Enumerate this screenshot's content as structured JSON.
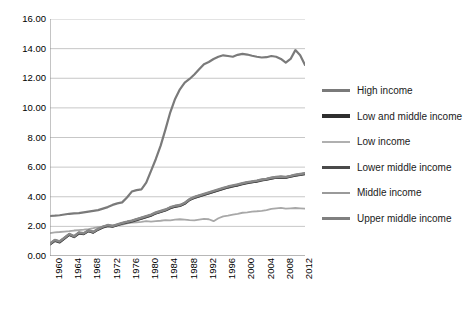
{
  "chart_data": {
    "type": "line",
    "title": "",
    "subtitle": "",
    "xlabel": "",
    "ylabel": "",
    "xlim": [
      1960,
      2013
    ],
    "ylim": [
      0.0,
      16.0
    ],
    "grid": true,
    "grid_axis": "y",
    "legend_position": "right",
    "y_ticks": [
      "0.00",
      "2.00",
      "4.00",
      "6.00",
      "8.00",
      "10.00",
      "12.00",
      "14.00",
      "16.00"
    ],
    "y_tick_values": [
      0,
      2,
      4,
      6,
      8,
      10,
      12,
      14,
      16
    ],
    "x_ticks": [
      "1960",
      "1964",
      "1968",
      "1972",
      "1976",
      "1980",
      "1984",
      "1988",
      "1992",
      "1996",
      "2000",
      "2004",
      "2008",
      "2012"
    ],
    "x_tick_values": [
      1960,
      1964,
      1968,
      1972,
      1976,
      1980,
      1984,
      1988,
      1992,
      1996,
      2000,
      2004,
      2008,
      2012
    ],
    "x_minor_step": 1,
    "x": [
      1960,
      1961,
      1962,
      1963,
      1964,
      1965,
      1966,
      1967,
      1968,
      1969,
      1970,
      1971,
      1972,
      1973,
      1974,
      1975,
      1976,
      1977,
      1978,
      1979,
      1980,
      1981,
      1982,
      1983,
      1984,
      1985,
      1986,
      1987,
      1988,
      1989,
      1990,
      1991,
      1992,
      1993,
      1994,
      1995,
      1996,
      1997,
      1998,
      1999,
      2000,
      2001,
      2002,
      2003,
      2004,
      2005,
      2006,
      2007,
      2008,
      2009,
      2010,
      2011,
      2012,
      2013
    ],
    "series": [
      {
        "name": "High income",
        "color": "#7a7a7a",
        "width": 2.2,
        "values": [
          2.7,
          2.72,
          2.75,
          2.8,
          2.85,
          2.88,
          2.9,
          2.95,
          3.0,
          3.05,
          3.1,
          3.2,
          3.3,
          3.45,
          3.55,
          3.62,
          3.95,
          4.35,
          4.45,
          4.5,
          4.95,
          5.75,
          6.55,
          7.45,
          8.55,
          9.7,
          10.6,
          11.25,
          11.7,
          11.95,
          12.25,
          12.6,
          12.95,
          13.1,
          13.3,
          13.45,
          13.55,
          13.5,
          13.45,
          13.58,
          13.65,
          13.6,
          13.52,
          13.45,
          13.4,
          13.42,
          13.5,
          13.45,
          13.3,
          13.05,
          13.3,
          13.9,
          13.55,
          12.9
        ]
      },
      {
        "name": "Low and middle income",
        "color": "#3a3a3a",
        "width": 2.4,
        "values": [
          0.8,
          1.05,
          0.95,
          1.2,
          1.45,
          1.3,
          1.55,
          1.5,
          1.7,
          1.6,
          1.8,
          1.95,
          2.05,
          2.0,
          2.1,
          2.2,
          2.28,
          2.35,
          2.45,
          2.55,
          2.65,
          2.75,
          2.9,
          3.0,
          3.1,
          3.25,
          3.35,
          3.4,
          3.55,
          3.8,
          3.95,
          4.05,
          4.15,
          4.25,
          4.35,
          4.45,
          4.55,
          4.65,
          4.72,
          4.78,
          4.88,
          4.95,
          5.0,
          5.05,
          5.12,
          5.18,
          5.25,
          5.3,
          5.32,
          5.3,
          5.38,
          5.45,
          5.5,
          5.55
        ]
      },
      {
        "name": "Low income",
        "color": "#a8a8a8",
        "width": 1.8,
        "values": [
          1.55,
          1.6,
          1.62,
          1.65,
          1.68,
          1.72,
          1.75,
          1.78,
          1.82,
          1.88,
          1.95,
          1.98,
          2.02,
          2.05,
          2.08,
          2.12,
          2.2,
          2.25,
          2.28,
          2.3,
          2.35,
          2.32,
          2.35,
          2.38,
          2.42,
          2.4,
          2.45,
          2.48,
          2.45,
          2.42,
          2.4,
          2.45,
          2.5,
          2.48,
          2.35,
          2.55,
          2.68,
          2.72,
          2.8,
          2.85,
          2.92,
          2.95,
          3.0,
          3.02,
          3.05,
          3.1,
          3.18,
          3.22,
          3.25,
          3.2,
          3.22,
          3.24,
          3.22,
          3.2
        ]
      },
      {
        "name": "Lower middle income",
        "color": "#4a4a4a",
        "width": 2.2,
        "values": [
          0.78,
          1.02,
          0.92,
          1.18,
          1.42,
          1.28,
          1.52,
          1.48,
          1.68,
          1.58,
          1.78,
          1.92,
          2.02,
          1.98,
          2.08,
          2.18,
          2.25,
          2.32,
          2.42,
          2.52,
          2.62,
          2.72,
          2.88,
          2.98,
          3.08,
          3.22,
          3.32,
          3.38,
          3.52,
          3.78,
          3.92,
          4.02,
          4.12,
          4.22,
          4.32,
          4.42,
          4.52,
          4.62,
          4.7,
          4.76,
          4.85,
          4.92,
          4.98,
          5.02,
          5.1,
          5.15,
          5.22,
          5.28,
          5.3,
          5.28,
          5.35,
          5.42,
          5.48,
          5.52
        ]
      },
      {
        "name": "Middle income",
        "color": "#909090",
        "width": 1.9,
        "values": [
          0.82,
          1.08,
          0.98,
          1.22,
          1.48,
          1.32,
          1.58,
          1.52,
          1.72,
          1.62,
          1.82,
          1.98,
          2.08,
          2.02,
          2.12,
          2.22,
          2.3,
          2.38,
          2.48,
          2.58,
          2.68,
          2.78,
          2.92,
          3.02,
          3.12,
          3.28,
          3.38,
          3.42,
          3.58,
          3.82,
          3.98,
          4.08,
          4.18,
          4.28,
          4.38,
          4.48,
          4.58,
          4.68,
          4.75,
          4.82,
          4.9,
          4.98,
          5.02,
          5.08,
          5.15,
          5.2,
          5.28,
          5.32,
          5.35,
          5.32,
          5.4,
          5.48,
          5.52,
          5.58
        ]
      },
      {
        "name": "Upper middle income",
        "color": "#888888",
        "width": 2.1,
        "values": [
          0.85,
          1.1,
          1.0,
          1.25,
          1.5,
          1.35,
          1.6,
          1.55,
          1.75,
          1.65,
          1.85,
          2.0,
          2.1,
          2.05,
          2.15,
          2.25,
          2.32,
          2.4,
          2.5,
          2.6,
          2.7,
          2.8,
          2.95,
          3.05,
          3.15,
          3.3,
          3.4,
          3.45,
          3.6,
          3.85,
          4.0,
          4.1,
          4.2,
          4.3,
          4.4,
          4.5,
          4.6,
          4.7,
          4.78,
          4.85,
          4.92,
          5.0,
          5.05,
          5.1,
          5.18,
          5.22,
          5.3,
          5.35,
          5.38,
          5.35,
          5.42,
          5.5,
          5.55,
          5.6
        ]
      }
    ]
  },
  "legend": {
    "items": [
      {
        "label": "High income",
        "color": "#7a7a7a",
        "thickness": "3px"
      },
      {
        "label": "Low and middle income",
        "color": "#2e2e2e",
        "thickness": "4px"
      },
      {
        "label": "Low income",
        "color": "#b0b0b0",
        "thickness": "2.5px"
      },
      {
        "label": "Lower middle income",
        "color": "#4a4a4a",
        "thickness": "3.5px"
      },
      {
        "label": "Middle income",
        "color": "#9a9a9a",
        "thickness": "2.5px"
      },
      {
        "label": "Upper middle income",
        "color": "#808080",
        "thickness": "3px"
      }
    ]
  },
  "axes": {
    "gridline_color": "#b9b9b9",
    "axis_color": "#8a8a8a"
  }
}
